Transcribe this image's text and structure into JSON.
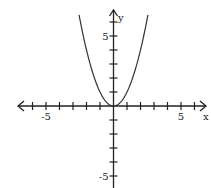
{
  "chart_data": {
    "type": "line",
    "title": "",
    "xlabel": "x",
    "ylabel": "y",
    "xlim": [
      -7,
      7
    ],
    "ylim": [
      -6,
      7
    ],
    "grid": false,
    "x_tick_step": 1,
    "y_tick_step": 1,
    "x_tick_labels": [
      {
        "value": -5,
        "label": "-5"
      },
      {
        "value": 5,
        "label": "5"
      }
    ],
    "y_tick_labels": [
      {
        "value": 5,
        "label": "5"
      },
      {
        "value": -5,
        "label": "-5"
      }
    ],
    "series": [
      {
        "name": "y = x^2",
        "function": "x^2",
        "x": [
          -2.55,
          -2,
          -1.5,
          -1,
          -0.5,
          0,
          0.5,
          1,
          1.5,
          2,
          2.55
        ],
        "values": [
          6.5,
          4,
          2.25,
          1,
          0.25,
          0,
          0.25,
          1,
          2.25,
          4,
          6.5
        ]
      }
    ],
    "colors": {
      "axis": "#222222",
      "curve": "#333333"
    }
  }
}
